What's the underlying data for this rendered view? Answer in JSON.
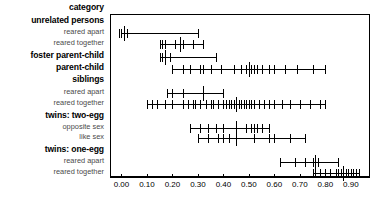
{
  "chart_data": {
    "type": "scatter",
    "title": "",
    "xlabel": "",
    "ylabel": "category",
    "xlim": [
      -0.045,
      0.975
    ],
    "xticks": [
      0.0,
      0.1,
      0.2,
      0.3,
      0.4,
      0.5,
      0.6,
      0.7,
      0.8,
      0.9
    ],
    "xticklabels": [
      "0.00",
      "0.10",
      "0.20",
      "0.30",
      "0.40",
      "0.50",
      "0.60",
      "0.70",
      "0.80",
      "0.90"
    ],
    "grid": false,
    "legend": "none",
    "category_header": "category",
    "groups": [
      {
        "label": "unrelated persons",
        "level": "major",
        "rows": [
          {
            "label": "reared apart",
            "level": "minor",
            "range": [
              0.0,
              0.3
            ],
            "median": 0.01,
            "points": [
              -0.01,
              0.0,
              0.0,
              0.01,
              0.02,
              0.3
            ]
          },
          {
            "label": "reared together",
            "level": "minor",
            "range": [
              0.15,
              0.32
            ],
            "median": 0.23,
            "points": [
              0.15,
              0.16,
              0.17,
              0.21,
              0.23,
              0.24,
              0.28,
              0.32
            ]
          }
        ]
      },
      {
        "label": "foster parent-child",
        "level": "major",
        "rows": [
          {
            "label": "",
            "level": "none",
            "range": [
              0.15,
              0.37
            ],
            "median": 0.17,
            "points": [
              0.15,
              0.16,
              0.17,
              0.19,
              0.37
            ]
          }
        ]
      },
      {
        "label": "parent-child",
        "level": "major",
        "rows": [
          {
            "label": "",
            "level": "none",
            "range": [
              0.2,
              0.8
            ],
            "median": 0.5,
            "points": [
              0.2,
              0.24,
              0.27,
              0.31,
              0.32,
              0.35,
              0.39,
              0.44,
              0.47,
              0.49,
              0.5,
              0.5,
              0.51,
              0.52,
              0.53,
              0.55,
              0.58,
              0.6,
              0.64,
              0.69,
              0.75,
              0.8
            ]
          }
        ]
      },
      {
        "label": "siblings",
        "level": "major",
        "rows": [
          {
            "label": "reared apart",
            "level": "minor",
            "range": [
              0.18,
              0.4
            ],
            "median": 0.32,
            "points": [
              0.18,
              0.2,
              0.24,
              0.32,
              0.4
            ]
          },
          {
            "label": "reared together",
            "level": "minor",
            "range": [
              0.1,
              0.8
            ],
            "median": 0.45,
            "points": [
              0.1,
              0.12,
              0.14,
              0.17,
              0.2,
              0.24,
              0.26,
              0.28,
              0.29,
              0.31,
              0.33,
              0.35,
              0.36,
              0.38,
              0.4,
              0.41,
              0.42,
              0.43,
              0.44,
              0.45,
              0.46,
              0.47,
              0.48,
              0.49,
              0.5,
              0.51,
              0.52,
              0.54,
              0.56,
              0.58,
              0.6,
              0.63,
              0.66,
              0.7,
              0.74,
              0.78,
              0.8
            ]
          }
        ]
      },
      {
        "label": "twins: two-egg",
        "level": "major",
        "rows": [
          {
            "label": "opposite sex",
            "level": "minor",
            "range": [
              0.27,
              0.58
            ],
            "median": 0.45,
            "points": [
              0.27,
              0.31,
              0.34,
              0.37,
              0.4,
              0.45,
              0.49,
              0.51,
              0.52,
              0.53,
              0.55,
              0.58
            ]
          },
          {
            "label": "like sex",
            "level": "minor",
            "range": [
              0.3,
              0.72
            ],
            "median": 0.45,
            "points": [
              0.3,
              0.34,
              0.38,
              0.4,
              0.42,
              0.45,
              0.52,
              0.58,
              0.6,
              0.66,
              0.72
            ]
          }
        ]
      },
      {
        "label": "twins: one-egg",
        "level": "major",
        "rows": [
          {
            "label": "reared apart",
            "level": "minor",
            "range": [
              0.62,
              0.85
            ],
            "median": 0.76,
            "points": [
              0.62,
              0.68,
              0.72,
              0.75,
              0.76,
              0.77,
              0.85
            ]
          },
          {
            "label": "reared together",
            "level": "minor",
            "range": [
              0.75,
              0.93
            ],
            "median": 0.87,
            "points": [
              0.75,
              0.76,
              0.78,
              0.8,
              0.82,
              0.84,
              0.85,
              0.86,
              0.87,
              0.87,
              0.88,
              0.89,
              0.9,
              0.91,
              0.92,
              0.93
            ]
          }
        ]
      }
    ],
    "label_rows": [
      {
        "text": "category",
        "level": "major",
        "y": 9
      },
      {
        "text": "unrelated persons",
        "level": "major",
        "y": 22
      },
      {
        "text": "reared apart",
        "level": "minor",
        "y": 33
      },
      {
        "text": "reared together",
        "level": "minor",
        "y": 44
      },
      {
        "text": "foster parent-child",
        "level": "major",
        "y": 57
      },
      {
        "text": "parent-child",
        "level": "major",
        "y": 69
      },
      {
        "text": "siblings",
        "level": "major",
        "y": 81
      },
      {
        "text": "reared apart",
        "level": "minor",
        "y": 93
      },
      {
        "text": "reared together",
        "level": "minor",
        "y": 104
      },
      {
        "text": "twins: two-egg",
        "level": "major",
        "y": 117
      },
      {
        "text": "opposite sex",
        "level": "minor",
        "y": 128
      },
      {
        "text": "like sex",
        "level": "minor",
        "y": 138
      },
      {
        "text": "twins: one-egg",
        "level": "major",
        "y": 151
      },
      {
        "text": "reared apart",
        "level": "minor",
        "y": 162
      },
      {
        "text": "reared together",
        "level": "minor",
        "y": 173
      }
    ],
    "row_y": [
      33,
      44,
      57,
      69,
      93,
      104,
      128,
      138,
      162,
      173
    ],
    "colors": {
      "ink": "#000000",
      "minor_label": "#4a4a4a",
      "background": "#ffffff"
    }
  }
}
